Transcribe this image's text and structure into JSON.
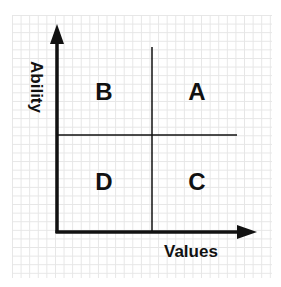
{
  "diagram": {
    "type": "quadrant-matrix",
    "x_axis_label": "Values",
    "y_axis_label": "Ability",
    "quadrants": {
      "top_left": "B",
      "top_right": "A",
      "bottom_left": "D",
      "bottom_right": "C"
    },
    "colors": {
      "ink": "#111111",
      "grid": "#e6e6e6",
      "background": "#ffffff"
    }
  }
}
